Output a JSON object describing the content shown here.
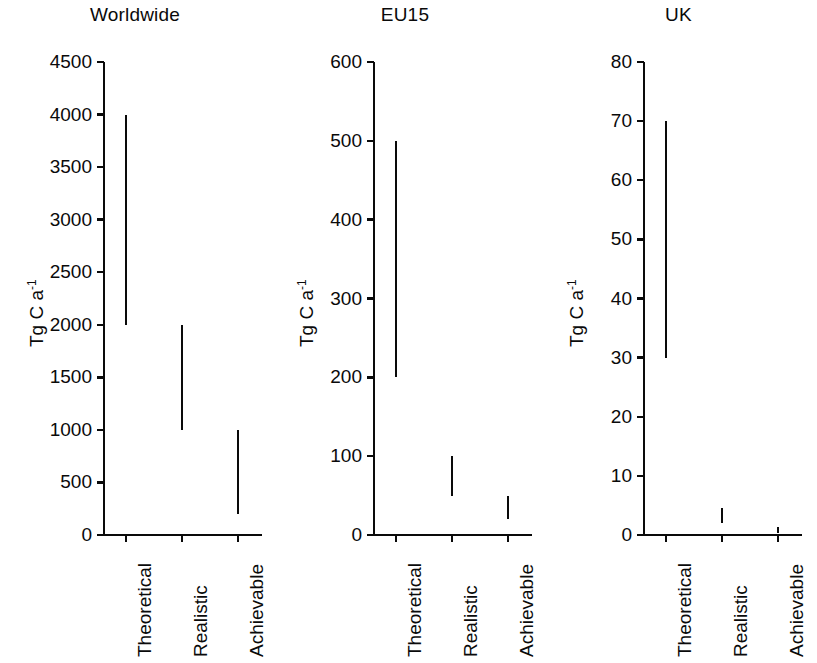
{
  "figure": {
    "width": 817,
    "height": 663,
    "background": "#ffffff",
    "ink_color": "#0a0a0a",
    "axis_title": "Tg C a",
    "axis_title_exponent": "-1",
    "categories": [
      "Theoretical",
      "Realistic",
      "Achievable"
    ]
  },
  "panels": [
    {
      "title": "Worldwide",
      "ylabel_main": "Tg C a",
      "ylabel_sup": "-1",
      "ymin": 0,
      "ymax": 4500,
      "ystep": 500,
      "ticks": [
        "0",
        "500",
        "1000",
        "1500",
        "2000",
        "2500",
        "3000",
        "3500",
        "4000",
        "4500"
      ],
      "bars": [
        {
          "category": "Theoretical",
          "low": 2000,
          "high": 4000
        },
        {
          "category": "Realistic",
          "low": 1000,
          "high": 2000
        },
        {
          "category": "Achievable",
          "low": 200,
          "high": 1000
        }
      ]
    },
    {
      "title": "EU15",
      "ylabel_main": "Tg C a",
      "ylabel_sup": "-1",
      "ymin": 0,
      "ymax": 600,
      "ystep": 100,
      "ticks": [
        "0",
        "100",
        "200",
        "300",
        "400",
        "500",
        "600"
      ],
      "bars": [
        {
          "category": "Theoretical",
          "low": 200,
          "high": 500
        },
        {
          "category": "Realistic",
          "low": 50,
          "high": 100
        },
        {
          "category": "Achievable",
          "low": 20,
          "high": 50
        }
      ]
    },
    {
      "title": "UK",
      "ylabel_main": "Tg C a",
      "ylabel_sup": "-1",
      "ymin": 0,
      "ymax": 80,
      "ystep": 10,
      "ticks": [
        "0",
        "10",
        "20",
        "30",
        "40",
        "50",
        "60",
        "70",
        "80"
      ],
      "bars": [
        {
          "category": "Theoretical",
          "low": 30,
          "high": 70
        },
        {
          "category": "Realistic",
          "low": 2,
          "high": 4.5
        },
        {
          "category": "Achievable",
          "low": 0.4,
          "high": 1.4
        }
      ]
    }
  ],
  "chart_data": {
    "type": "bar",
    "title": "",
    "subtitle": "",
    "xlabel": "",
    "ylabel": "Tg C a-1",
    "grid": false,
    "legend": "none",
    "note": "Three side-by-side panels of vertical range bars (low-high interval for each category). No fill; each bar is a thin vertical line segment spanning its low-high range.",
    "categories": [
      "Theoretical",
      "Realistic",
      "Achievable"
    ],
    "panels": [
      {
        "name": "Worldwide",
        "ylim": [
          0,
          4500
        ],
        "yticks": [
          0,
          500,
          1000,
          1500,
          2000,
          2500,
          3000,
          3500,
          4000,
          4500
        ],
        "ranges": [
          [
            2000,
            4000
          ],
          [
            1000,
            2000
          ],
          [
            200,
            1000
          ]
        ],
        "low": [
          2000,
          1000,
          200
        ],
        "high": [
          4000,
          2000,
          1000
        ]
      },
      {
        "name": "EU15",
        "ylim": [
          0,
          600
        ],
        "yticks": [
          0,
          100,
          200,
          300,
          400,
          500,
          600
        ],
        "ranges": [
          [
            200,
            500
          ],
          [
            50,
            100
          ],
          [
            20,
            50
          ]
        ],
        "low": [
          200,
          50,
          20
        ],
        "high": [
          500,
          100,
          50
        ]
      },
      {
        "name": "UK",
        "ylim": [
          0,
          80
        ],
        "yticks": [
          0,
          10,
          20,
          30,
          40,
          50,
          60,
          70,
          80
        ],
        "ranges": [
          [
            30,
            70
          ],
          [
            2,
            4.5
          ],
          [
            0.4,
            1.4
          ]
        ],
        "low": [
          30,
          2,
          0.4
        ],
        "high": [
          70,
          4.5,
          1.4
        ]
      }
    ]
  }
}
